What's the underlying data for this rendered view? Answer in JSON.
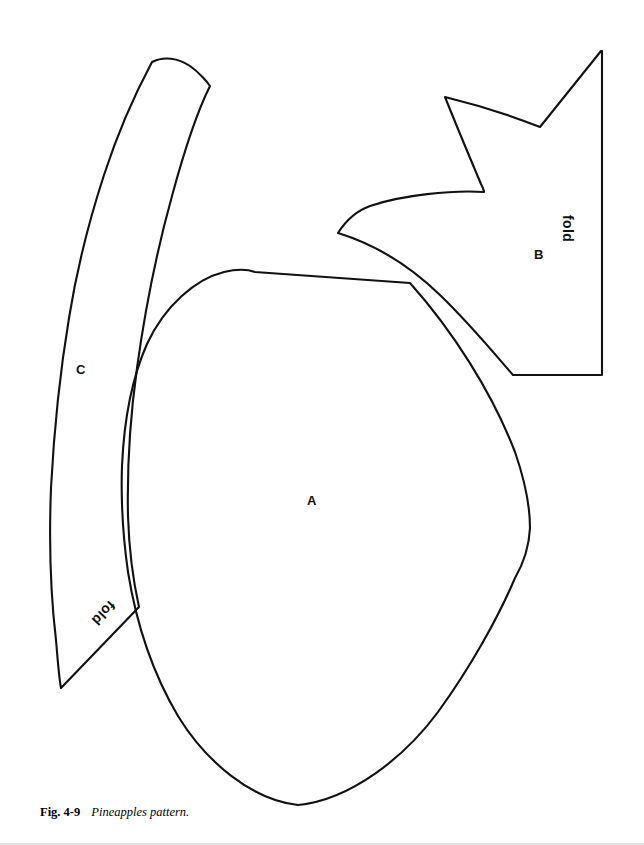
{
  "figure": {
    "caption_number": "Fig. 4-9",
    "caption_text": "Pineapples pattern.",
    "background_color": "#ffffff",
    "line_color": "#111111"
  },
  "pieces": [
    {
      "id": "A",
      "label": "A",
      "description": "large pineapple body piece",
      "fold_label": null
    },
    {
      "id": "B",
      "label": "B",
      "description": "pineapple crown leaves piece with straight fold edge on right",
      "fold_label": "fold"
    },
    {
      "id": "C",
      "label": "C",
      "description": "curved leaf piece with fold edge at lower left",
      "fold_label": "fold"
    }
  ],
  "labels": {
    "a": "A",
    "b": "B",
    "c": "C",
    "fold_b": "fold",
    "fold_c": "fold"
  }
}
